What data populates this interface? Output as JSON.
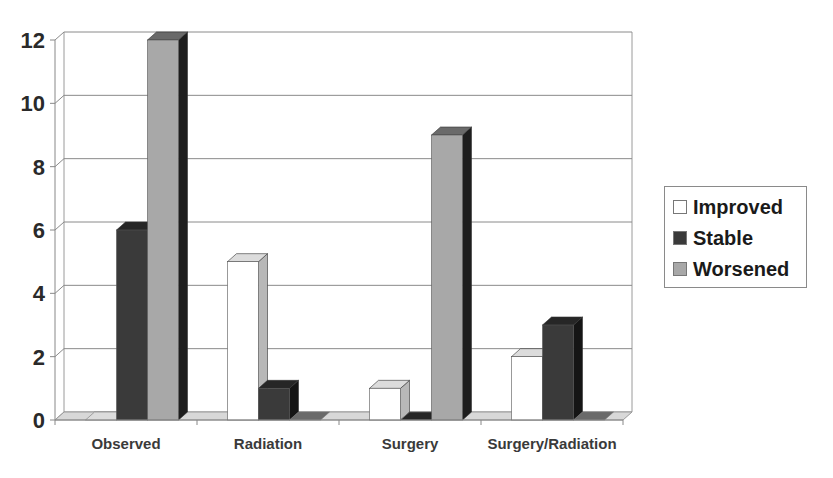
{
  "chart_data": {
    "type": "bar",
    "style": "3d-clustered-column",
    "title": "",
    "xlabel": "",
    "ylabel": "",
    "categories": [
      "Observed",
      "Radiation",
      "Surgery",
      "Surgery/Radiation"
    ],
    "series": [
      {
        "name": "Improved",
        "values": [
          0,
          5,
          1,
          2
        ],
        "color": "#ffffff"
      },
      {
        "name": "Stable",
        "values": [
          6,
          1,
          0,
          3
        ],
        "color": "#3a3a3a"
      },
      {
        "name": "Worsened",
        "values": [
          12,
          0,
          9,
          0
        ],
        "color": "#a8a8a8"
      }
    ],
    "ylim": [
      0,
      12
    ],
    "yticks": [
      0,
      2,
      4,
      6,
      8,
      10,
      12
    ],
    "grid": true,
    "legend_position": "right"
  },
  "legend": {
    "items": [
      {
        "label": "Improved",
        "color": "#ffffff"
      },
      {
        "label": "Stable",
        "color": "#3a3a3a"
      },
      {
        "label": "Worsened",
        "color": "#a8a8a8"
      }
    ]
  }
}
